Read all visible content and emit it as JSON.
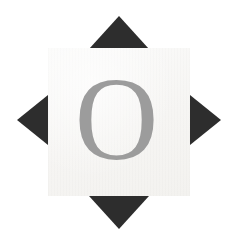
{
  "canvas": {
    "width": 238,
    "height": 246,
    "background_color": "#ffffff"
  },
  "tile": {
    "name": "letter-tile",
    "glyph": "O",
    "glyph_color": "#9c9c9c",
    "fill_color": "#f6f5f3",
    "x": 48,
    "y": 48,
    "width": 142,
    "height": 148
  },
  "markers": {
    "color": "#2d2d2d",
    "count": 4,
    "items": [
      {
        "id": "top",
        "direction": "up",
        "label": "north-marker",
        "apex_x": 119,
        "apex_y": 16,
        "base_width": 60,
        "depth": 33
      },
      {
        "id": "right",
        "direction": "right",
        "label": "east-marker",
        "apex_x": 221,
        "apex_y": 120,
        "base_width": 50,
        "depth": 31
      },
      {
        "id": "bottom",
        "direction": "down",
        "label": "south-marker",
        "apex_x": 119,
        "apex_y": 230,
        "base_width": 60,
        "depth": 33
      },
      {
        "id": "left",
        "direction": "left",
        "label": "west-marker",
        "apex_x": 17,
        "apex_y": 120,
        "base_width": 50,
        "depth": 31
      }
    ]
  }
}
